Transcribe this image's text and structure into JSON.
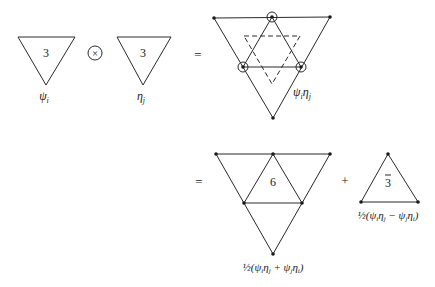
{
  "row1": {
    "triangle_psi": {
      "label_inside": "3",
      "caption": "ψ",
      "caption_sub": "i"
    },
    "operator": "×",
    "triangle_eta": {
      "label_inside": "3",
      "caption": "η",
      "caption_sub": "j"
    },
    "equals": "=",
    "product": {
      "caption": "ψ",
      "caption_sub1": "i",
      "caption_mid": "η",
      "caption_sub2": "j"
    }
  },
  "row2": {
    "equals": "=",
    "sextet": {
      "label_inside": "6",
      "caption": "½(ψ",
      "caption_full": "½(ψiηj + ψjηi)"
    },
    "plus": "+",
    "antitriplet": {
      "label_inside": "3",
      "bar": true,
      "caption_full": "½(ψiηj − ψjηi)"
    }
  },
  "colors": {
    "ink": "#1a1a1a",
    "background": "#ffffff"
  }
}
